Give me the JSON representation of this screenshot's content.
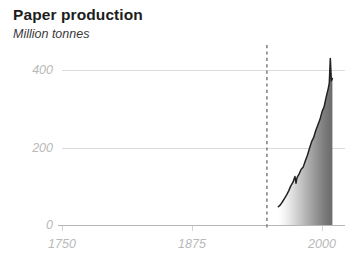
{
  "chart": {
    "title": "Paper production",
    "subtitle": "Million tonnes"
  },
  "chart_data": {
    "type": "area",
    "title": "Paper production",
    "subtitle": "Million tonnes",
    "xlabel": "",
    "ylabel": "Million tonnes",
    "xlim": [
      1700,
      2030
    ],
    "ylim": [
      0,
      440
    ],
    "grid": true,
    "legend": null,
    "y_ticks": [
      0,
      200,
      400
    ],
    "y_tick_labels": [
      "0",
      "200",
      "400"
    ],
    "x_ticks": [
      1750,
      1875,
      2000
    ],
    "x_tick_labels": [
      "1750",
      "1875",
      "2000"
    ],
    "fill": {
      "type": "horizontal-gradient",
      "from_color": "#ffffff",
      "to_color": "#6b6b6b"
    },
    "line_color": "#222222",
    "annotations": [
      {
        "type": "vertical-dashed-line",
        "x": 1947,
        "color": "#8c8c8c",
        "label": ""
      }
    ],
    "series": [
      {
        "name": "Paper production",
        "x": [
          1958,
          1960,
          1962,
          1964,
          1966,
          1968,
          1970,
          1972,
          1974,
          1975,
          1976,
          1978,
          1980,
          1982,
          1984,
          1986,
          1988,
          1990,
          1992,
          1994,
          1996,
          1998,
          2000,
          2002,
          2004,
          2006,
          2007,
          2008,
          2009,
          2010
        ],
        "values": [
          47,
          52,
          60,
          69,
          78,
          88,
          101,
          110,
          125,
          108,
          122,
          132,
          144,
          150,
          166,
          180,
          198,
          215,
          226,
          244,
          258,
          272,
          292,
          305,
          330,
          352,
          366,
          430,
          372,
          378
        ]
      }
    ]
  }
}
